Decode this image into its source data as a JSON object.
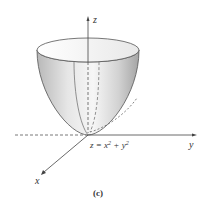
{
  "figure": {
    "caption": "(c)",
    "equation": {
      "lhs": "z = x",
      "exp1": "2",
      "mid": " + y",
      "exp2": "2"
    },
    "axes": {
      "x_label": "x",
      "y_label": "y",
      "z_label": "z"
    },
    "surface": "paraboloid",
    "colors": {
      "axis": "#444444",
      "surface_light": "#f4f4f4",
      "surface_dark": "#a8a8a8",
      "outline": "#555555"
    }
  }
}
